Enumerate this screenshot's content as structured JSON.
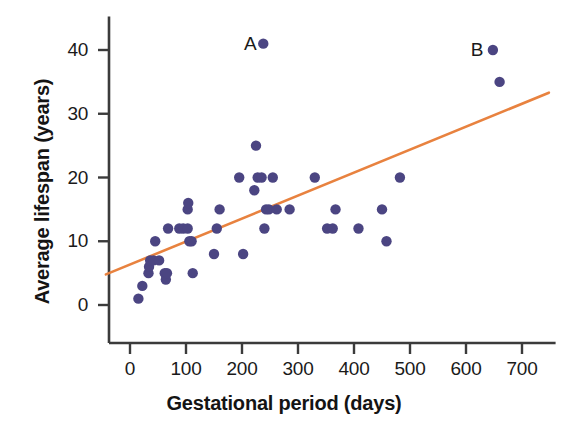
{
  "chart_data": {
    "type": "scatter",
    "title": "",
    "xlabel": "Gestational period (days)",
    "ylabel": "Average lifespan (years)",
    "xlim": [
      -50,
      760
    ],
    "ylim": [
      -4,
      44
    ],
    "xticks": [
      0,
      100,
      200,
      300,
      400,
      500,
      600,
      700
    ],
    "xtick_labels": [
      "0",
      "100",
      "200",
      "300",
      "400",
      "500",
      "600",
      "700"
    ],
    "yticks": [
      0,
      10,
      20,
      30,
      40
    ],
    "ytick_labels": [
      "0",
      "10",
      "20",
      "30",
      "40"
    ],
    "grid": false,
    "legend": "none",
    "point_color": "#4b4582",
    "trendline_color": "#e8823f",
    "axis_color": "#3b3b3b",
    "points": [
      {
        "x": 15,
        "y": 1
      },
      {
        "x": 22,
        "y": 3
      },
      {
        "x": 33,
        "y": 5
      },
      {
        "x": 34,
        "y": 6
      },
      {
        "x": 36,
        "y": 7
      },
      {
        "x": 42,
        "y": 7
      },
      {
        "x": 45,
        "y": 10
      },
      {
        "x": 52,
        "y": 7
      },
      {
        "x": 62,
        "y": 5
      },
      {
        "x": 64,
        "y": 4
      },
      {
        "x": 66,
        "y": 5
      },
      {
        "x": 68,
        "y": 12
      },
      {
        "x": 88,
        "y": 12
      },
      {
        "x": 95,
        "y": 12
      },
      {
        "x": 103,
        "y": 12
      },
      {
        "x": 103,
        "y": 15
      },
      {
        "x": 104,
        "y": 16
      },
      {
        "x": 106,
        "y": 10
      },
      {
        "x": 110,
        "y": 10
      },
      {
        "x": 112,
        "y": 5
      },
      {
        "x": 150,
        "y": 8
      },
      {
        "x": 155,
        "y": 12
      },
      {
        "x": 160,
        "y": 15
      },
      {
        "x": 195,
        "y": 20
      },
      {
        "x": 202,
        "y": 8
      },
      {
        "x": 222,
        "y": 18
      },
      {
        "x": 225,
        "y": 25
      },
      {
        "x": 228,
        "y": 20
      },
      {
        "x": 235,
        "y": 20
      },
      {
        "x": 238,
        "y": 41
      },
      {
        "x": 240,
        "y": 12
      },
      {
        "x": 243,
        "y": 15
      },
      {
        "x": 248,
        "y": 15
      },
      {
        "x": 255,
        "y": 20
      },
      {
        "x": 262,
        "y": 15
      },
      {
        "x": 285,
        "y": 15
      },
      {
        "x": 330,
        "y": 20
      },
      {
        "x": 352,
        "y": 12
      },
      {
        "x": 362,
        "y": 12
      },
      {
        "x": 367,
        "y": 15
      },
      {
        "x": 408,
        "y": 12
      },
      {
        "x": 450,
        "y": 15
      },
      {
        "x": 458,
        "y": 10
      },
      {
        "x": 482,
        "y": 20
      },
      {
        "x": 648,
        "y": 40
      },
      {
        "x": 660,
        "y": 35
      }
    ],
    "annotations": [
      {
        "label": "A",
        "x": 215,
        "y": 41
      },
      {
        "label": "B",
        "x": 620,
        "y": 40
      }
    ],
    "trendline": {
      "x_start": -43,
      "y_start": 4.8,
      "x_end": 748,
      "y_end": 33.3
    }
  }
}
